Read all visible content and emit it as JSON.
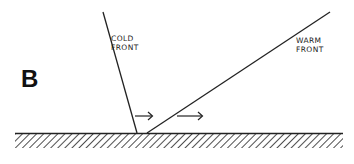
{
  "figure": {
    "panel_letter": "B",
    "cold_front": {
      "label_line1": "COLD",
      "label_line2": "FRONT"
    },
    "warm_front": {
      "label_line1": "WARM",
      "label_line2": "FRONT"
    },
    "arrows": [
      {
        "direction": "right",
        "position": "ahead of cold front"
      },
      {
        "direction": "right",
        "position": "ahead of warm front"
      }
    ],
    "ground": {
      "style": "hatched"
    },
    "colors": {
      "line": "#222222",
      "background": "#ffffff"
    }
  }
}
